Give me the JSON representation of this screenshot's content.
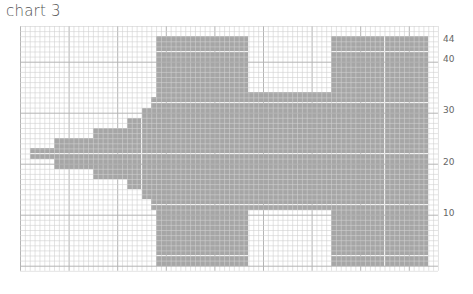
{
  "title": "chart 3",
  "chart_data": {
    "type": "heatmap",
    "title": "chart 3",
    "grid": {
      "cols": 86,
      "rows": 48,
      "cell_w": 4.86,
      "cell_h": 5.1
    },
    "colors": {
      "filled": "#a6a6a6",
      "empty": "#ffffff",
      "line": "#d0d0d0",
      "major_line": "#b4b4b4"
    },
    "row_labels": [
      {
        "label": "44",
        "row": 44
      },
      {
        "label": "40",
        "row": 40
      },
      {
        "label": "30",
        "row": 30
      },
      {
        "label": "20",
        "row": 20
      },
      {
        "label": "10",
        "row": 10
      }
    ],
    "filled_blocks": [
      {
        "name": "tip",
        "cols": [
          2,
          6
        ],
        "rows_from_top": [
          24,
          25
        ]
      },
      {
        "name": "step-a",
        "cols": [
          7,
          14
        ],
        "rows_from_top": [
          22,
          27
        ]
      },
      {
        "name": "step-b",
        "cols": [
          15,
          21
        ],
        "rows_from_top": [
          20,
          29
        ]
      },
      {
        "name": "step-c",
        "cols": [
          22,
          24
        ],
        "rows_from_top": [
          18,
          31
        ]
      },
      {
        "name": "step-d",
        "cols": [
          25,
          26
        ],
        "rows_from_top": [
          16,
          33
        ]
      },
      {
        "name": "step-e",
        "cols": [
          27,
          27
        ],
        "rows_from_top": [
          14,
          35
        ]
      },
      {
        "name": "left-tower",
        "cols": [
          28,
          46
        ],
        "rows_from_top": [
          2,
          46
        ]
      },
      {
        "name": "middle",
        "cols": [
          47,
          63
        ],
        "rows_from_top": [
          13,
          35
        ]
      },
      {
        "name": "right-tower",
        "cols": [
          64,
          83
        ],
        "rows_from_top": [
          2,
          46
        ]
      }
    ]
  }
}
